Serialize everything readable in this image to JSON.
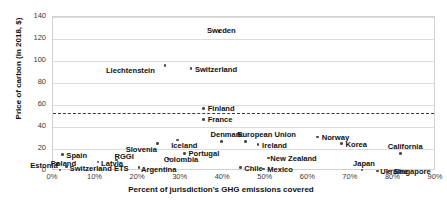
{
  "chart_data": {
    "type": "scatter",
    "title": "",
    "xlabel": "Percent of jurisdiction's GHG emissions covered",
    "ylabel": "Price of carbon (in 2018, $)",
    "xlim": [
      0,
      90
    ],
    "ylim": [
      0,
      140
    ],
    "xticks": [
      "0%",
      "10%",
      "20%",
      "30%",
      "40%",
      "50%",
      "60%",
      "70%",
      "80%",
      "90%"
    ],
    "xtick_values": [
      0,
      10,
      20,
      30,
      40,
      50,
      60,
      70,
      80,
      90
    ],
    "yticks": [
      "0",
      "20",
      "40",
      "60",
      "80",
      "100",
      "120",
      "140"
    ],
    "ytick_values": [
      0,
      20,
      40,
      60,
      80,
      100,
      120,
      140
    ],
    "grid": true,
    "legend": "none",
    "annotations": [
      {
        "name": "threshold-line",
        "type": "hline",
        "value": 53,
        "style": "dashed"
      }
    ],
    "points": [
      {
        "label": "Sweden",
        "x": 39.0,
        "y": 127,
        "lx": -12,
        "ly": -4
      },
      {
        "label": "Liechtenstein",
        "x": 26.3,
        "y": 96,
        "lx": -59,
        "ly": 2
      },
      {
        "label": "Switzerland",
        "x": 32.4,
        "y": 93,
        "lx": 4,
        "ly": -3
      },
      {
        "label": "Finland",
        "x": 35.4,
        "y": 57,
        "lx": 4,
        "ly": -3
      },
      {
        "label": "France",
        "x": 35.4,
        "y": 47,
        "lx": 4,
        "ly": -3
      },
      {
        "label": "Denmark",
        "x": 39.6,
        "y": 27,
        "lx": -11,
        "ly": -10
      },
      {
        "label": "European Union",
        "x": 45.2,
        "y": 27,
        "lx": -8,
        "ly": -10
      },
      {
        "label": "Ireland",
        "x": 48.2,
        "y": 24,
        "lx": 4,
        "ly": -3
      },
      {
        "label": "Norway",
        "x": 62.2,
        "y": 31,
        "lx": 4,
        "ly": -3
      },
      {
        "label": "Korea",
        "x": 67.8,
        "y": 25,
        "lx": 4,
        "ly": -3
      },
      {
        "label": "California",
        "x": 81.7,
        "y": 16,
        "lx": -13,
        "ly": -10
      },
      {
        "label": "Slovenia",
        "x": 24.6,
        "y": 25,
        "lx": -32,
        "ly": 2
      },
      {
        "label": "Iceland",
        "x": 29.2,
        "y": 28,
        "lx": -6,
        "ly": 2
      },
      {
        "label": "Portugal",
        "x": 30.9,
        "y": 16,
        "lx": 4,
        "ly": -3
      },
      {
        "label": "Colombia",
        "x": 27.2,
        "y": 11,
        "lx": -5,
        "ly": -3
      },
      {
        "label": "New Zealand",
        "x": 50.6,
        "y": 12,
        "lx": 2,
        "ly": -3
      },
      {
        "label": "Chile",
        "x": 44.0,
        "y": 3,
        "lx": 4,
        "ly": -3
      },
      {
        "label": "Mexico",
        "x": 49.4,
        "y": 2,
        "lx": 4,
        "ly": -3
      },
      {
        "label": "Japan",
        "x": 72.6,
        "y": 1,
        "lx": -9,
        "ly": -10
      },
      {
        "label": "Ukraine",
        "x": 76.2,
        "y": 0,
        "lx": 3,
        "ly": -3
      },
      {
        "label": "Singapore",
        "x": 79.1,
        "y": 0,
        "lx": 4,
        "ly": -3
      },
      {
        "label": "Spain",
        "x": 2.2,
        "y": 15,
        "lx": 4,
        "ly": -3
      },
      {
        "label": "Estonia",
        "x": 1.0,
        "y": 7,
        "lx": -27,
        "ly": -1
      },
      {
        "label": "Latvia",
        "x": 10.6,
        "y": 8,
        "lx": 3,
        "ly": -2
      },
      {
        "label": "RGGI",
        "x": 14.9,
        "y": 10,
        "lx": -2,
        "ly": -7
      },
      {
        "label": "Poland",
        "x": 1.6,
        "y": 1,
        "lx": -9,
        "ly": -10
      },
      {
        "label": "Switzerland ETS",
        "x": 3.2,
        "y": 4,
        "lx": 3,
        "ly": -2
      },
      {
        "label": "Argentina",
        "x": 20.2,
        "y": 3,
        "lx": 2,
        "ly": -2
      }
    ]
  },
  "colors": {
    "marker": "#4a4a4a",
    "grid": "#dcdcdc",
    "threshold": "#3a3a3a",
    "text": "#111111",
    "background": "#ffffff"
  }
}
